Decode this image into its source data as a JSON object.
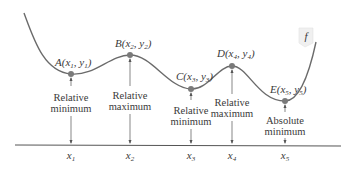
{
  "diagram": {
    "function_label": "f",
    "colors": {
      "curve": "#6b6b6b",
      "point": "#7a7a7a",
      "axis": "#555555",
      "text": "#3a3a3a",
      "tag_fill": "#eeeeee"
    },
    "points": [
      {
        "name": "A",
        "coord": "x1, y1",
        "letter": "A",
        "xsub": "1",
        "ysub": "1",
        "description_line1": "Relative",
        "description_line2": "minimum",
        "x_label": "x",
        "x_sub": "1"
      },
      {
        "name": "B",
        "coord": "x2, y2",
        "letter": "B",
        "xsub": "2",
        "ysub": "2",
        "description_line1": "Relative",
        "description_line2": "maximum",
        "x_label": "x",
        "x_sub": "2"
      },
      {
        "name": "C",
        "coord": "x3, y3",
        "letter": "C",
        "xsub": "3",
        "ysub": "3",
        "description_line1": "Relative",
        "description_line2": "minimum",
        "x_label": "x",
        "x_sub": "3"
      },
      {
        "name": "D",
        "coord": "x4, y4",
        "letter": "D",
        "xsub": "4",
        "ysub": "4",
        "description_line1": "Relative",
        "description_line2": "maximum",
        "x_label": "x",
        "x_sub": "4"
      },
      {
        "name": "E",
        "coord": "x5, y5",
        "letter": "E",
        "xsub": "5",
        "ysub": "5",
        "description_line1": "Absolute",
        "description_line2": "minimum",
        "x_label": "x",
        "x_sub": "5"
      }
    ]
  }
}
